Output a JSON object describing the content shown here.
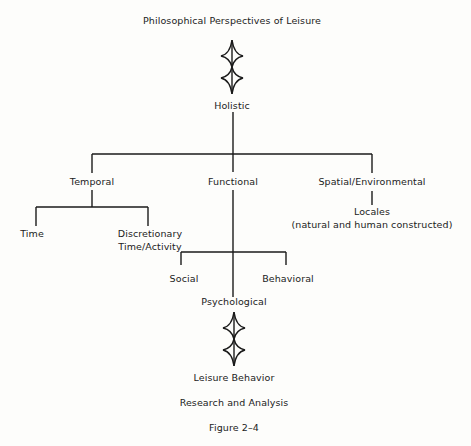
{
  "diagram": {
    "title": "Philosophical Perspectives of Leisure",
    "root": "Holistic",
    "branches": {
      "temporal": {
        "label": "Temporal",
        "children": [
          "Time",
          "Discretionary",
          "Time/Activity"
        ]
      },
      "functional": {
        "label": "Functional",
        "children": [
          "Social",
          "Psychological",
          "Behavioral"
        ]
      },
      "spatial": {
        "label": "Spatial/Environmental",
        "children": [
          "Locales",
          "(natural and human constructed)"
        ]
      }
    },
    "outcome": "Leisure Behavior",
    "subtitle": "Research and Analysis",
    "caption": "Figure 2–4"
  },
  "colors": {
    "background": "#fdfdfb",
    "line": "#1a1a1a",
    "text": "#222222"
  }
}
